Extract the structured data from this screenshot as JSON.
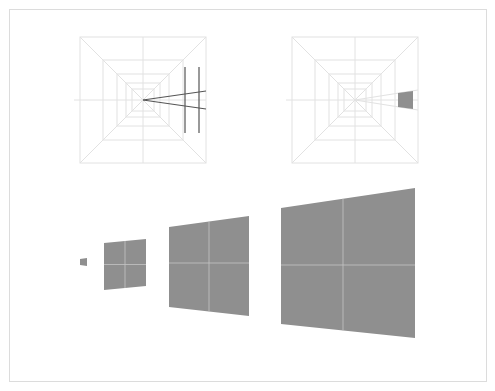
{
  "canvas": {
    "width": 495,
    "height": 391,
    "background": "#ffffff"
  },
  "frame": {
    "x": 9.5,
    "y": 9.5,
    "width": 477,
    "height": 372,
    "stroke": "#dcdcdc"
  },
  "colors": {
    "grid": "#e2e2e2",
    "dark_line": "#555555",
    "quad_fill": "#8f8f8f",
    "quad_divider": "#c4c4c4"
  },
  "diagrams": [
    {
      "name": "tunnel-grid-left",
      "center": [
        143,
        100
      ],
      "outer": [
        80,
        37,
        206,
        163
      ],
      "rings": [
        [
          80,
          37,
          206,
          163
        ],
        [
          103,
          60,
          183,
          140
        ],
        [
          117,
          74,
          169,
          126
        ],
        [
          126,
          83,
          160,
          117
        ],
        [
          132,
          89,
          154,
          111
        ]
      ],
      "dark_vertical_lines": [
        {
          "x": 185,
          "y1": 67,
          "y2": 133
        },
        {
          "x": 199,
          "y1": 67,
          "y2": 133
        }
      ],
      "converging_lines": [
        {
          "from": [
            143,
            100
          ],
          "to": [
            206,
            91
          ]
        },
        {
          "from": [
            143,
            100
          ],
          "to": [
            206,
            109
          ]
        }
      ]
    },
    {
      "name": "tunnel-grid-right",
      "center": [
        355,
        100
      ],
      "outer": [
        292,
        37,
        418,
        163
      ],
      "rings": [
        [
          292,
          37,
          418,
          163
        ],
        [
          315,
          60,
          395,
          140
        ],
        [
          329,
          74,
          381,
          126
        ],
        [
          338,
          83,
          372,
          117
        ],
        [
          344,
          89,
          366,
          111
        ]
      ],
      "guide_lines": [
        {
          "from": [
            355,
            100
          ],
          "to": [
            418,
            90
          ]
        },
        {
          "from": [
            355,
            100
          ],
          "to": [
            418,
            110
          ]
        }
      ],
      "small_quad": [
        [
          398,
          93
        ],
        [
          413,
          91
        ],
        [
          413,
          109
        ],
        [
          398,
          107
        ]
      ]
    }
  ],
  "quads": [
    {
      "name": "quad-1",
      "points": [
        [
          80,
          259
        ],
        [
          87,
          258
        ],
        [
          87,
          266
        ],
        [
          80,
          265
        ]
      ],
      "mid_x": 83.5,
      "mid_y": 262,
      "dividers": false
    },
    {
      "name": "quad-2",
      "points": [
        [
          104,
          243
        ],
        [
          146,
          239
        ],
        [
          146,
          286
        ],
        [
          104,
          290
        ]
      ],
      "mid_x": 125,
      "mid_y": 264.5,
      "dividers": true
    },
    {
      "name": "quad-3",
      "points": [
        [
          169,
          227
        ],
        [
          249,
          216
        ],
        [
          249,
          316
        ],
        [
          169,
          307
        ]
      ],
      "mid_x": 209,
      "mid_y": 263,
      "dividers": true
    },
    {
      "name": "quad-4",
      "points": [
        [
          281,
          208
        ],
        [
          415,
          188
        ],
        [
          415,
          338
        ],
        [
          281,
          324
        ]
      ],
      "mid_x": 343,
      "mid_y": 265,
      "dividers": true
    }
  ]
}
